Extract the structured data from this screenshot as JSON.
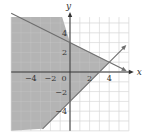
{
  "chart_data": {
    "type": "line",
    "title": "",
    "xlabel": "x",
    "ylabel": "y",
    "xlim": [
      -6,
      6
    ],
    "ylim": [
      -6,
      5.6
    ],
    "grid": true,
    "x_ticks": [
      {
        "value": -4,
        "label": "−4"
      },
      {
        "value": -2,
        "label": "−2"
      },
      {
        "value": 0,
        "label": "0"
      },
      {
        "value": 2,
        "label": "2"
      },
      {
        "value": 4,
        "label": "4"
      }
    ],
    "y_ticks": [
      {
        "value": 4,
        "label": "4"
      },
      {
        "value": 2,
        "label": "2"
      },
      {
        "value": -2,
        "label": "−2"
      },
      {
        "value": -4,
        "label": "−4"
      }
    ],
    "series": [
      {
        "name": "boundary-1",
        "equation": "y = -x/2 + 3",
        "slope": -0.5,
        "intercept": 3,
        "x": [
          -6,
          5.6
        ],
        "y": [
          6,
          0.2
        ],
        "arrow_end": true
      },
      {
        "name": "boundary-2",
        "equation": "y = x - 3",
        "slope": 1,
        "intercept": -3,
        "x": [
          -2.8,
          5.6
        ],
        "y": [
          -5.8,
          2.6
        ],
        "arrow_end": true
      }
    ],
    "shaded_region": {
      "description": "y <= -x/2 + 3 and y >= x - 3",
      "vertex": [
        4,
        1
      ],
      "polygon": [
        [
          -6,
          5.6
        ],
        [
          -0.8,
          5.6
        ],
        [
          0,
          3
        ],
        [
          4,
          1
        ],
        [
          0,
          -3
        ],
        [
          -2.8,
          -5.8
        ],
        [
          -6,
          -6
        ]
      ]
    },
    "colors": {
      "shade": "#b4b4b4",
      "grid": "#d9d9d9",
      "axis": "#333333",
      "line": "#6e6e6e"
    }
  }
}
